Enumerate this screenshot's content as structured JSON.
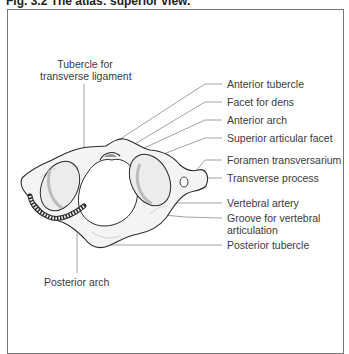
{
  "figure": {
    "title": "Fig. 3.2  The atlas: superior view."
  },
  "labels": {
    "tubercle_transverse_ligament_line1": "Tubercle for",
    "tubercle_transverse_ligament_line2": "transverse ligament",
    "anterior_tubercle": "Anterior tubercle",
    "facet_for_dens": "Facet for dens",
    "anterior_arch": "Anterior arch",
    "superior_articular_facet": "Superior articular facet",
    "foramen_transversarium": "Foramen transversarium",
    "transverse_process": "Transverse process",
    "vertebral_artery": "Vertebral artery",
    "groove_line1": "Groove for vertebral",
    "groove_line2": "articulation",
    "posterior_tubercle": "Posterior tubercle",
    "posterior_arch": "Posterior arch"
  },
  "colors": {
    "line": "#8a8a8a",
    "bone_outline": "#2a2a2a",
    "bone_fill": "#f4f4f4",
    "shading": "#c8c8c8"
  }
}
